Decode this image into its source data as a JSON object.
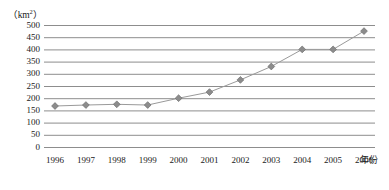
{
  "chart_data": {
    "type": "line",
    "title": "",
    "xlabel": "年份",
    "ylabel": "",
    "unit_label": "km",
    "unit_exponent": "2",
    "unit_label_full": "（km2）",
    "categories": [
      "1996",
      "1997",
      "1998",
      "1999",
      "2000",
      "2001",
      "2002",
      "2003",
      "2004",
      "2005",
      "2006"
    ],
    "values": [
      168,
      172,
      175,
      172,
      200,
      225,
      275,
      330,
      400,
      400,
      475
    ],
    "series": [
      {
        "name": "面积",
        "values": [
          168,
          172,
          175,
          172,
          200,
          225,
          275,
          330,
          400,
          400,
          475
        ]
      }
    ],
    "ylim": [
      0,
      500
    ],
    "ytick_step": 50,
    "yticks": [
      "500",
      "450",
      "400",
      "350",
      "300",
      "250",
      "200",
      "150",
      "100",
      "50",
      "0"
    ],
    "ytick_values": [
      500,
      450,
      400,
      350,
      300,
      250,
      200,
      150,
      100,
      50,
      0
    ],
    "grid": true,
    "grid_axis": "horizontal",
    "legend": false,
    "legend_position": "none",
    "marker": "diamond",
    "colors": {
      "grid": "#808080",
      "line": "#9a9a9a",
      "marker_fill": "#8c8c8c",
      "marker_stroke": "#6e6e6e",
      "text": "#1a1a1a"
    }
  }
}
